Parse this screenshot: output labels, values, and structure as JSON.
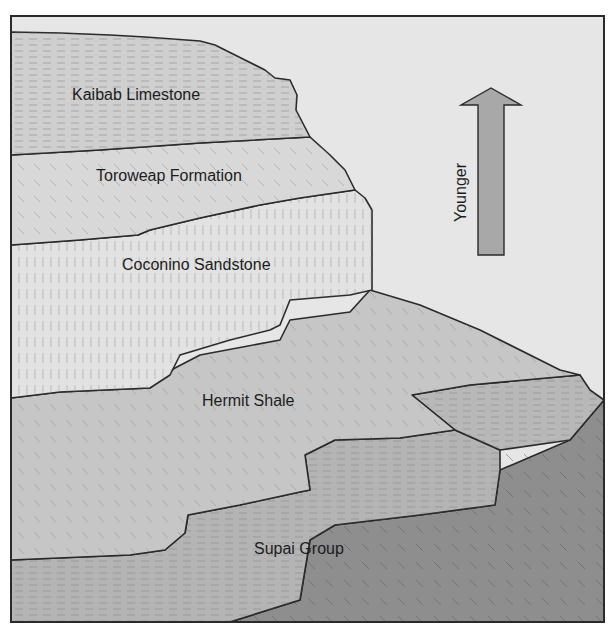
{
  "figure": {
    "type": "geologic-cross-section",
    "background_color": "#e6e6e6",
    "frame_color": "#2a2a2a"
  },
  "layers": [
    {
      "id": "kaibab",
      "label": "Kaibab Limestone",
      "color": "#cfcfcf"
    },
    {
      "id": "toroweap",
      "label": "Toroweap Formation",
      "color": "#d8d8d8"
    },
    {
      "id": "coconino",
      "label": "Coconino Sandstone",
      "color": "#e2e2e2"
    },
    {
      "id": "hermit",
      "label": "Hermit Shale",
      "color": "#c6c6c6"
    },
    {
      "id": "supai",
      "label": "Supai Group",
      "color": "#b4b4b4"
    },
    {
      "id": "lower",
      "label": "",
      "color": "#8e8e8e"
    }
  ],
  "age_arrow": {
    "label": "Younger",
    "direction": "up",
    "color": "#a8a8a8"
  }
}
